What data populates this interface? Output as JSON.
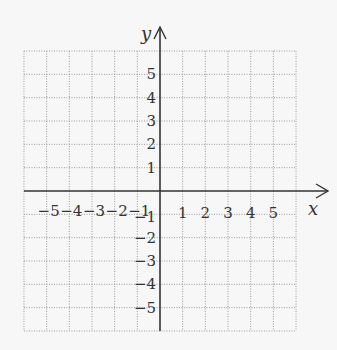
{
  "diagram": {
    "type": "cartesian-coordinate-grid",
    "x_axis": {
      "label": "x",
      "range": [
        -6,
        6
      ],
      "tick_labels": [
        {
          "value": -5,
          "text": "−5"
        },
        {
          "value": -4,
          "text": "−4"
        },
        {
          "value": -3,
          "text": "−3"
        },
        {
          "value": -2,
          "text": "−2"
        },
        {
          "value": -1,
          "text": "−1"
        },
        {
          "value": 1,
          "text": "1"
        },
        {
          "value": 2,
          "text": "2"
        },
        {
          "value": 3,
          "text": "3"
        },
        {
          "value": 4,
          "text": "4"
        },
        {
          "value": 5,
          "text": "5"
        }
      ]
    },
    "y_axis": {
      "label": "y",
      "range": [
        -6,
        6
      ],
      "tick_labels": [
        {
          "value": 5,
          "text": "5"
        },
        {
          "value": 4,
          "text": "4"
        },
        {
          "value": 3,
          "text": "3"
        },
        {
          "value": 2,
          "text": "2"
        },
        {
          "value": 1,
          "text": "1"
        },
        {
          "value": -1,
          "text": "−1"
        },
        {
          "value": -2,
          "text": "−2"
        },
        {
          "value": -3,
          "text": "−3"
        },
        {
          "value": -4,
          "text": "−4"
        },
        {
          "value": -5,
          "text": "−5"
        }
      ]
    },
    "grid": {
      "style": "dotted",
      "spacing": 1
    },
    "colors": {
      "background": "#f7f7f7",
      "grid": "#9a9a9a",
      "axis": "#333333",
      "text": "#333333"
    }
  }
}
